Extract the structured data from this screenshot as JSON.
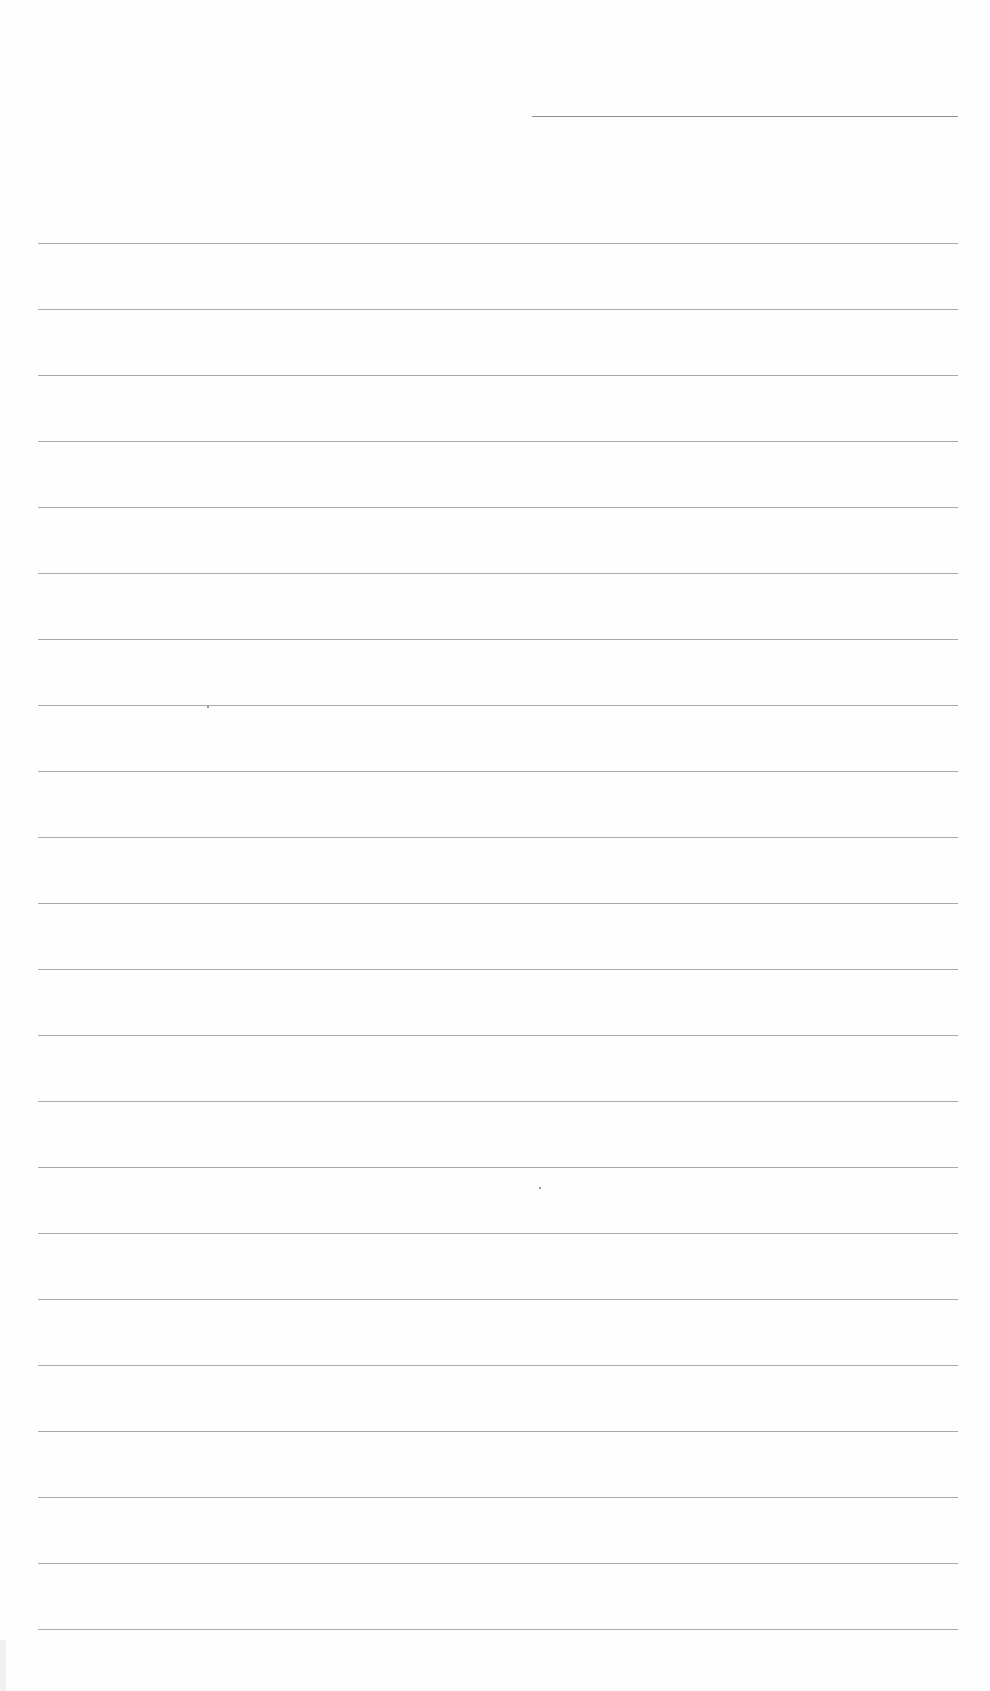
{
  "page": {
    "type": "lined-paper",
    "background_color": "#fefefe",
    "line_color": "#9a9a9a"
  },
  "header_line": {
    "x1": 532,
    "x2": 958,
    "y": 116
  },
  "ruled_lines": {
    "x1": 38,
    "x2": 958,
    "y_positions": [
      243,
      309,
      375,
      441,
      507,
      573,
      639,
      705,
      771,
      837,
      903,
      969,
      1035,
      1101,
      1167,
      1233,
      1299,
      1365,
      1431,
      1497,
      1563,
      1629
    ]
  },
  "marks": [
    {
      "x": 207,
      "y": 706
    },
    {
      "x": 539,
      "y": 1187
    }
  ]
}
